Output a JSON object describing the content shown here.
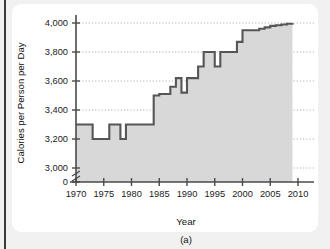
{
  "figure": {
    "caption": "(a)"
  },
  "chart_data": {
    "type": "area",
    "title": "",
    "xlabel": "Year",
    "ylabel": "Calories per Person per Day",
    "xlim": [
      1970,
      2010
    ],
    "ylim": [
      3000,
      4000
    ],
    "y_axis_zero_label": "0",
    "y_axis_break": true,
    "grid": true,
    "legend": "none",
    "x_ticks": [
      1970,
      1975,
      1980,
      1985,
      1990,
      1995,
      2000,
      2005,
      2010
    ],
    "x_tick_labels": [
      "1970",
      "1975",
      "1980",
      "1985",
      "1990",
      "1995",
      "2000",
      "2005",
      "2010"
    ],
    "y_ticks": [
      0,
      3000,
      3200,
      3400,
      3600,
      3800,
      4000
    ],
    "y_tick_labels": [
      "0",
      "3,000",
      "3,200",
      "3,400",
      "3,600",
      "3,800",
      "4,000"
    ],
    "x": [
      1970,
      1971,
      1972,
      1973,
      1974,
      1975,
      1976,
      1977,
      1978,
      1979,
      1980,
      1981,
      1982,
      1983,
      1984,
      1985,
      1986,
      1987,
      1988,
      1989,
      1990,
      1991,
      1992,
      1993,
      1994,
      1995,
      1996,
      1997,
      1998,
      1999,
      2000,
      2001,
      2002,
      2003,
      2004,
      2005,
      2006,
      2007,
      2008,
      2009
    ],
    "values": [
      3300,
      3300,
      3300,
      3200,
      3200,
      3200,
      3300,
      3300,
      3200,
      3300,
      3300,
      3300,
      3300,
      3300,
      3500,
      3510,
      3510,
      3560,
      3620,
      3520,
      3620,
      3620,
      3700,
      3800,
      3800,
      3700,
      3800,
      3800,
      3800,
      3870,
      3950,
      3950,
      3950,
      3960,
      3970,
      3980,
      3985,
      3990,
      3995,
      4000
    ],
    "series_name": "Calories per person per day",
    "colors": {
      "line": "#565656",
      "fill": "#d8d8d8",
      "axis": "#4a4a4a",
      "grid": "#8a8a8a",
      "card": "#ffffff",
      "page": "#f1f1f1"
    }
  }
}
